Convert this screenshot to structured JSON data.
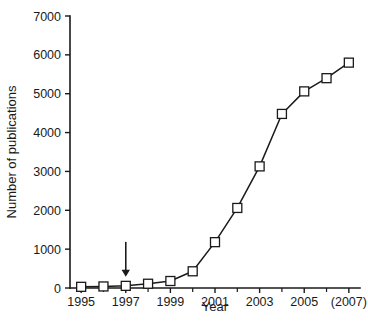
{
  "chart_data": {
    "type": "line",
    "title": "",
    "xlabel": "Year",
    "ylabel": "Number of publications",
    "x": [
      1995,
      1996,
      1997,
      1998,
      1999,
      2000,
      2001,
      2002,
      2003,
      2004,
      2005,
      2006,
      2007
    ],
    "values": [
      30,
      40,
      55,
      110,
      180,
      430,
      1180,
      2060,
      3130,
      4480,
      5060,
      5400,
      5800
    ],
    "series": [
      {
        "name": "Number of publications",
        "values": [
          30,
          40,
          55,
          110,
          180,
          430,
          1180,
          2060,
          3130,
          4480,
          5060,
          5400,
          5800
        ]
      }
    ],
    "xlim": [
      1994.5,
      2007.5
    ],
    "ylim": [
      0,
      7000
    ],
    "ytick_values": [
      0,
      1000,
      2000,
      3000,
      4000,
      5000,
      6000,
      7000
    ],
    "ytick_labels": [
      "0",
      "1000",
      "2000",
      "3000",
      "4000",
      "5000",
      "6000",
      "7000"
    ],
    "xtick_values": [
      1995,
      1996,
      1997,
      1998,
      1999,
      2000,
      2001,
      2002,
      2003,
      2004,
      2005,
      2006,
      2007
    ],
    "xtick_labeled": [
      {
        "value": 1995,
        "label": "1995"
      },
      {
        "value": 1997,
        "label": "1997"
      },
      {
        "value": 1999,
        "label": "1999"
      },
      {
        "value": 2001,
        "label": "2001"
      },
      {
        "value": 2003,
        "label": "2003"
      },
      {
        "value": 2005,
        "label": "2005"
      },
      {
        "value": 2007,
        "label": "(2007)"
      }
    ],
    "grid": false,
    "legend": null,
    "marker_style": "open-square",
    "line_color": "#1a1a1a",
    "marker_fill": "#ffffff",
    "background": "#ffffff",
    "annotations": [
      {
        "type": "arrow",
        "label": "",
        "points_to_x": 1997,
        "points_to_y": 55,
        "direction": "down"
      }
    ]
  }
}
